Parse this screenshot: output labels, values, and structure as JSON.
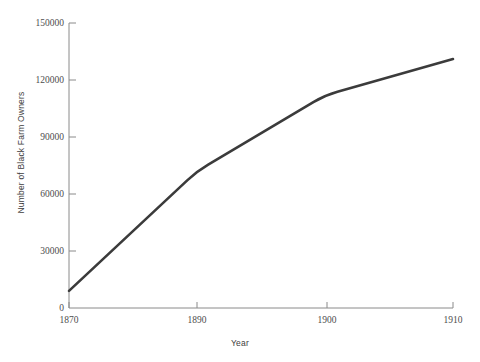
{
  "chart_data": {
    "type": "line",
    "title": "",
    "xlabel": "Year",
    "ylabel": "Number of Black Farm Owners",
    "categories": [
      "1870",
      "1890",
      "1900",
      "1910"
    ],
    "x": [
      1870,
      1890,
      1900,
      1910
    ],
    "values": [
      9000,
      72000,
      112000,
      131000
    ],
    "series": [
      {
        "name": "Number of Black Farm Owners",
        "values": [
          9000,
          72000,
          112000,
          131000
        ],
        "color": "#3b3b3b"
      }
    ],
    "xtick_labels": [
      "1870",
      "1890",
      "1900",
      "1910"
    ],
    "ytick_labels": [
      "0",
      "30000",
      "60000",
      "90000",
      "120000",
      "150000"
    ],
    "ytick_values": [
      0,
      30000,
      60000,
      90000,
      120000,
      150000
    ],
    "ylim": [
      0,
      150000
    ],
    "x_scale": "categorical",
    "grid": "off",
    "legend": "none",
    "line_color": "#3b3b3b",
    "axis_color": "#8a8a8a"
  },
  "axes": {
    "x_title": "Year",
    "y_title": "Number of Black Farm Owners"
  },
  "yticks": [
    {
      "label": "150000"
    },
    {
      "label": "120000"
    },
    {
      "label": "90000"
    },
    {
      "label": "60000"
    },
    {
      "label": "30000"
    },
    {
      "label": "0"
    }
  ],
  "xticks": [
    {
      "label": "1870"
    },
    {
      "label": "1890"
    },
    {
      "label": "1900"
    },
    {
      "label": "1910"
    }
  ]
}
